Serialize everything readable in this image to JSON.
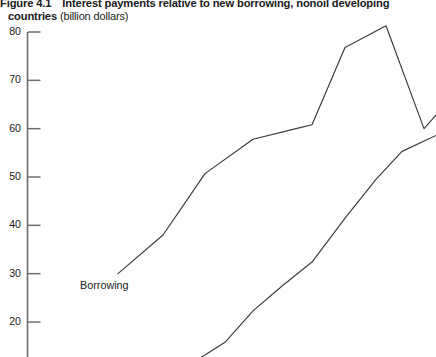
{
  "figure": {
    "number": "Figure  4.1",
    "title": "Interest payments relative to new borrowing, nonoil developing",
    "title_continued": "countries",
    "units": "(billion dollars)"
  },
  "chart_data": {
    "type": "line",
    "title": "Interest payments relative to new borrowing, nonoil developing countries",
    "subtitle": "Figure 4.1",
    "xlabel": "",
    "ylabel": "billion dollars",
    "ylim": [
      12,
      80
    ],
    "yticks": [
      80,
      70,
      60,
      50,
      40,
      30,
      20
    ],
    "ytick_labels": [
      "80",
      "70",
      "60",
      "50",
      "40",
      "30",
      "20"
    ],
    "grid": false,
    "legend": "inline-annotation",
    "note": "Image is cropped at the bottom; x-axis and lower portion of the interest series are not visible.",
    "series": [
      {
        "name": "Borrowing",
        "label_text": "Borrowing",
        "color": "#3a3a3a",
        "points": [
          {
            "x": 118,
            "y": 30.0
          },
          {
            "x": 163,
            "y": 38.0
          },
          {
            "x": 205,
            "y": 50.7
          },
          {
            "x": 253,
            "y": 57.8
          },
          {
            "x": 296,
            "y": 60.0
          },
          {
            "x": 312,
            "y": 60.8
          },
          {
            "x": 345,
            "y": 76.8
          },
          {
            "x": 386,
            "y": 81.3
          },
          {
            "x": 424,
            "y": 60.0
          },
          {
            "x": 436,
            "y": 62.8
          }
        ]
      },
      {
        "name": "Interest payments",
        "label_text": "",
        "color": "#3a3a3a",
        "points": [
          {
            "x": 196,
            "y": 12.0
          },
          {
            "x": 225,
            "y": 15.8
          },
          {
            "x": 253,
            "y": 22.3
          },
          {
            "x": 283,
            "y": 27.6
          },
          {
            "x": 312,
            "y": 32.4
          },
          {
            "x": 347,
            "y": 42.0
          },
          {
            "x": 376,
            "y": 49.5
          },
          {
            "x": 402,
            "y": 55.3
          },
          {
            "x": 436,
            "y": 58.6
          }
        ]
      }
    ]
  },
  "axis": {
    "line_color": "#6e6e6e",
    "tick_color": "#6e6e6e"
  }
}
